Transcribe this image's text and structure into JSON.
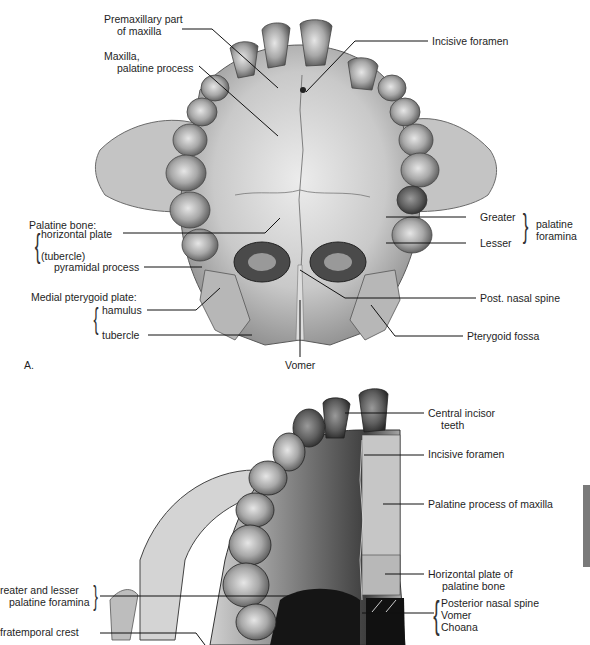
{
  "page": {
    "header_text": "",
    "side_tab_color": "#7a7a7a"
  },
  "figure_a": {
    "panel_label": "A.",
    "labels": {
      "premaxillary_1": "Premaxillary part",
      "premaxillary_2": "of maxilla",
      "maxilla_1": "Maxilla,",
      "maxilla_2": "palatine process",
      "incisive_foramen": "Incisive foramen",
      "palatine_bone": "Palatine bone:",
      "horizontal_plate": "horizontal plate",
      "tubercle_paren": "(tubercle)",
      "pyramidal_process": "pyramidal process",
      "medial_pterygoid_plate": "Medial pterygoid plate:",
      "hamulus": "hamulus",
      "tubercle": "tubercle",
      "vomer": "Vomer",
      "greater": "Greater",
      "lesser": "Lesser",
      "palatine_1": "palatine",
      "palatine_2": "foramina",
      "post_nasal_spine": "Post. nasal spine",
      "pterygoid_fossa": "Pterygoid fossa"
    }
  },
  "figure_b": {
    "labels": {
      "central_incisor_1": "Central incisor",
      "central_incisor_2": "teeth",
      "incisive_foramen": "Incisive foramen",
      "palatine_process": "Palatine process of maxilla",
      "horizontal_plate_1": "Horizontal plate of",
      "horizontal_plate_2": "palatine bone",
      "posterior_nasal_spine": "Posterior nasal spine",
      "vomer": "Vomer",
      "choana": "Choana",
      "greater_lesser_1": "reater and lesser",
      "greater_lesser_2": "palatine foramina",
      "infratemporal_crest": "fratemporal crest"
    }
  },
  "colors": {
    "bone_light": "#d8d8d8",
    "bone_mid": "#a9a9a9",
    "bone_dark": "#555555",
    "shadow": "#1c1c1c",
    "leader": "#111111"
  }
}
